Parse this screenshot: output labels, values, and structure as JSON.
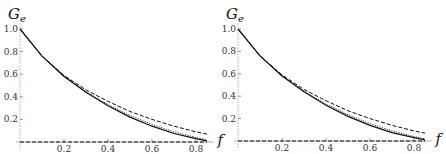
{
  "chart_data": [
    {
      "type": "line",
      "title": "",
      "xlabel": "f",
      "ylabel": "G_e",
      "xlim": [
        0,
        0.85
      ],
      "ylim": [
        0,
        1.0
      ],
      "xticks": [
        "0.2",
        "0.4",
        "0.6",
        "0.8"
      ],
      "yticks": [
        "0.2",
        "0.4",
        "0.6",
        "0.8",
        "1.0"
      ],
      "grid": false,
      "legend": null,
      "x": [
        0,
        0.1,
        0.2,
        0.3,
        0.4,
        0.5,
        0.6,
        0.7,
        0.8,
        0.85
      ],
      "series": [
        {
          "name": "solid",
          "style": "solid",
          "values": [
            1.0,
            0.76,
            0.58,
            0.44,
            0.32,
            0.22,
            0.14,
            0.075,
            0.03,
            0.01
          ]
        },
        {
          "name": "dotted",
          "style": "dotted",
          "values": [
            1.0,
            0.76,
            0.585,
            0.445,
            0.33,
            0.235,
            0.155,
            0.09,
            0.04,
            0.02
          ]
        },
        {
          "name": "dashed",
          "style": "dashed",
          "values": [
            1.0,
            0.76,
            0.59,
            0.46,
            0.36,
            0.27,
            0.2,
            0.14,
            0.09,
            0.07
          ]
        },
        {
          "name": "baseline",
          "style": "dashed",
          "values": [
            0,
            0,
            0,
            0,
            0,
            0,
            0,
            0,
            0,
            0
          ]
        }
      ]
    },
    {
      "type": "line",
      "title": "",
      "xlabel": "f",
      "ylabel": "G_e",
      "xlim": [
        0,
        0.85
      ],
      "ylim": [
        0,
        1.0
      ],
      "xticks": [
        "0.2",
        "0.4",
        "0.6",
        "0.8"
      ],
      "yticks": [
        "0.2",
        "0.4",
        "0.6",
        "0.8",
        "1.0"
      ],
      "grid": false,
      "legend": null,
      "x": [
        0,
        0.1,
        0.2,
        0.3,
        0.4,
        0.5,
        0.6,
        0.7,
        0.8,
        0.85
      ],
      "series": [
        {
          "name": "solid",
          "style": "solid",
          "values": [
            1.0,
            0.76,
            0.58,
            0.44,
            0.32,
            0.22,
            0.14,
            0.075,
            0.03,
            0.01
          ]
        },
        {
          "name": "dotted",
          "style": "dotted",
          "values": [
            1.0,
            0.76,
            0.585,
            0.445,
            0.33,
            0.235,
            0.155,
            0.09,
            0.04,
            0.02
          ]
        },
        {
          "name": "dashed",
          "style": "dashed",
          "values": [
            1.0,
            0.76,
            0.59,
            0.46,
            0.36,
            0.27,
            0.2,
            0.14,
            0.09,
            0.07
          ]
        },
        {
          "name": "baseline",
          "style": "dashed",
          "values": [
            0,
            0,
            0,
            0,
            0,
            0,
            0,
            0,
            0,
            0
          ]
        }
      ]
    }
  ],
  "labels": {
    "y_main": "G",
    "y_sub": "e",
    "x": "f"
  }
}
